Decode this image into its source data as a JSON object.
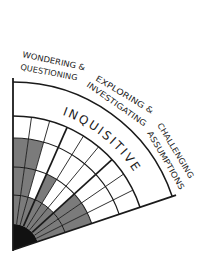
{
  "diagram": {
    "title": "INQUISITIVE",
    "categories": [
      {
        "line1": "WONDERING &",
        "line2": "QUESTIONING"
      },
      {
        "line1": "EXPLORING &",
        "line2": "INVESTIGATING"
      },
      {
        "line1": "CHALLENGING",
        "line2": "ASSUMPTIONS"
      }
    ],
    "grid": {
      "sectors_per_category": 3,
      "rings": 4,
      "shading_note": "rows = rings from center outward; columns = sub-sectors from vertical edge clockwise; 1 = shaded",
      "shading": [
        [
          1,
          1,
          1,
          1,
          1,
          1,
          1,
          1,
          1
        ],
        [
          1,
          1,
          0,
          1,
          0,
          0,
          1,
          1,
          1
        ],
        [
          1,
          1,
          0,
          0,
          0,
          0,
          0,
          0,
          0
        ],
        [
          0,
          0,
          0,
          0,
          0,
          0,
          0,
          0,
          0
        ]
      ]
    },
    "colors": {
      "shade": "#7b7b7b",
      "line": "#1a1a1a",
      "center": "#111111",
      "background": "#ffffff"
    }
  }
}
